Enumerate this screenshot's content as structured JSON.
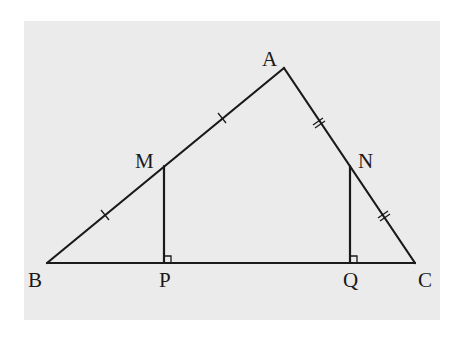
{
  "colors": {
    "panel_background": "#ebebeb",
    "page_background": "#ffffff",
    "stroke": "#1a1a1a"
  },
  "panel": {
    "x": 24,
    "y": 21,
    "width": 416,
    "height": 299
  },
  "points": {
    "A": {
      "x": 284,
      "y": 68
    },
    "B": {
      "x": 47,
      "y": 263
    },
    "C": {
      "x": 415,
      "y": 263
    },
    "M": {
      "x": 164,
      "y": 166
    },
    "N": {
      "x": 350,
      "y": 166
    },
    "P": {
      "x": 164,
      "y": 263
    },
    "Q": {
      "x": 350,
      "y": 263
    }
  },
  "labels": {
    "A": "A",
    "B": "B",
    "C": "C",
    "M": "M",
    "N": "N",
    "P": "P",
    "Q": "Q"
  },
  "segments": [
    {
      "name": "segment-AB",
      "from": "A",
      "to": "B"
    },
    {
      "name": "segment-AC",
      "from": "A",
      "to": "C"
    },
    {
      "name": "segment-BC",
      "from": "B",
      "to": "C"
    },
    {
      "name": "segment-MP",
      "from": "M",
      "to": "P"
    },
    {
      "name": "segment-NQ",
      "from": "N",
      "to": "Q"
    }
  ],
  "tick_marks": [
    {
      "segment": "BM",
      "count": 1
    },
    {
      "segment": "MA",
      "count": 1
    },
    {
      "segment": "AN",
      "count": 2
    },
    {
      "segment": "NC",
      "count": 2
    }
  ],
  "right_angles": [
    "P",
    "Q"
  ]
}
